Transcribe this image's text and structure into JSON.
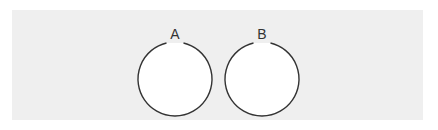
{
  "diagram": {
    "background": "#efefef",
    "stroke_color": "#333333",
    "sets": [
      {
        "label": "A",
        "cx": 175,
        "cy": 79,
        "r": 37
      },
      {
        "label": "B",
        "cx": 262,
        "cy": 79,
        "r": 37
      }
    ]
  }
}
